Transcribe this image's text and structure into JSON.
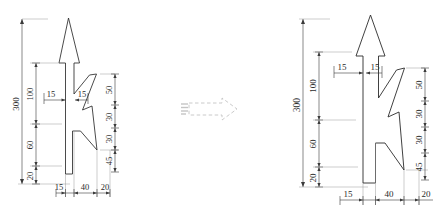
{
  "canvas": {
    "width": 439,
    "height": 220,
    "background": "#ffffff",
    "line_color": "#2b2b2b",
    "dim_color": "#3a3a3a",
    "ghost_color": "#bdbdbd"
  },
  "figures": [
    {
      "id": "left-figure",
      "name": "lightning-arrow-symbol-before",
      "scale": "small",
      "shape_name": "lightning-arrow-outline",
      "vertical_dimensions_left": {
        "overall": "300",
        "chain": [
          "100",
          "60",
          "20"
        ]
      },
      "vertical_dimensions_right": {
        "chain": [
          "50",
          "30",
          "30",
          "45"
        ]
      },
      "horizontal_dimensions_bottom": [
        "15",
        "40",
        "20"
      ],
      "leader_labels": [
        "15",
        "15"
      ]
    },
    {
      "id": "right-figure",
      "name": "lightning-arrow-symbol-after",
      "scale": "large",
      "shape_name": "lightning-arrow-outline",
      "vertical_dimensions_left": {
        "overall": "300",
        "chain": [
          "100",
          "60",
          "20"
        ]
      },
      "vertical_dimensions_right": {
        "chain": [
          "50",
          "30",
          "30",
          "45"
        ]
      },
      "horizontal_dimensions_bottom": [
        "15",
        "40",
        "20"
      ],
      "leader_labels": [
        "15",
        "15"
      ]
    }
  ],
  "transition": {
    "name": "dashed-transform-arrow",
    "direction": "right",
    "style": "dashed-outline",
    "ghost_mark": "",
    "color": "#b9b9b9"
  }
}
